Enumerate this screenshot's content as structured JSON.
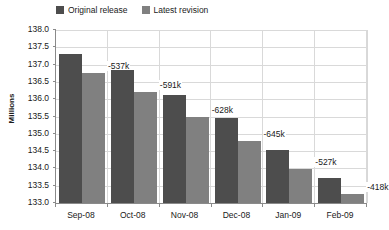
{
  "chart_data": {
    "type": "bar",
    "title": "",
    "subtitle": "",
    "xlabel": "",
    "ylabel": "Millions",
    "ylim": [
      133.0,
      138.0
    ],
    "ytick_step": 0.5,
    "ytick_labels": [
      "138.0",
      "137.5",
      "137.0",
      "136.5",
      "136.0",
      "135.5",
      "135.0",
      "134.5",
      "134.0",
      "133.5",
      "133.0"
    ],
    "ytick_values": [
      138.0,
      137.5,
      137.0,
      136.5,
      136.0,
      135.5,
      135.0,
      134.5,
      134.0,
      133.5,
      133.0
    ],
    "grid": true,
    "legend_position": "top",
    "categories": [
      "Sep-08",
      "Oct-08",
      "Nov-08",
      "Dec-08",
      "Jan-09",
      "Feb-09"
    ],
    "series": [
      {
        "name": "Original release",
        "color": "#4d4d4d",
        "values": [
          137.3,
          136.85,
          136.12,
          135.46,
          134.52,
          133.72
        ]
      },
      {
        "name": "Latest revision",
        "color": "#808080",
        "values": [
          136.75,
          136.22,
          135.5,
          134.8,
          133.98,
          133.27
        ]
      }
    ],
    "annotations": [
      {
        "category": "Sep-08",
        "text": "-537k",
        "value": -537000
      },
      {
        "category": "Oct-08",
        "text": "-591k",
        "value": -591000
      },
      {
        "category": "Nov-08",
        "text": "-628k",
        "value": -628000
      },
      {
        "category": "Dec-08",
        "text": "-645k",
        "value": -645000
      },
      {
        "category": "Jan-09",
        "text": "-527k",
        "value": -527000
      },
      {
        "category": "Feb-09",
        "text": "-418k",
        "value": -418000
      }
    ]
  },
  "legend": {
    "items": [
      {
        "label": "Original release",
        "color": "#4d4d4d"
      },
      {
        "label": "Latest revision",
        "color": "#808080"
      }
    ]
  },
  "axes": {
    "y_title": "Millions",
    "y_labels": [
      "138.0",
      "137.5",
      "137.0",
      "136.5",
      "136.0",
      "135.5",
      "135.0",
      "134.5",
      "134.0",
      "133.5",
      "133.0"
    ],
    "x_labels": [
      "Sep-08",
      "Oct-08",
      "Nov-08",
      "Dec-08",
      "Jan-09",
      "Feb-09"
    ]
  },
  "labels": {
    "values": [
      "-537k",
      "-591k",
      "-628k",
      "-645k",
      "-527k",
      "-418k"
    ]
  },
  "colors": {
    "original": "#4d4d4d",
    "revision": "#808080",
    "grid": "#d9d9d9",
    "axis": "#8a8a8a",
    "background": "#ffffff",
    "text": "#1a1a1a"
  }
}
